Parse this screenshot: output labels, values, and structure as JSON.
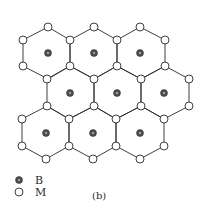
{
  "figure": {
    "label": "(b)"
  },
  "legend": {
    "items": [
      {
        "symbol": "filled-circle",
        "label": "B"
      },
      {
        "symbol": "open-circle",
        "label": "M"
      }
    ]
  },
  "colors": {
    "line": "#2a2a2a",
    "b_atom": "#4a4a4a",
    "m_atom_fill": "#ffffff"
  },
  "lattice": {
    "rows": 3,
    "hexagons_per_row": 3,
    "hexagon_centers_B": [
      [
        48,
        53
      ],
      [
        94,
        53
      ],
      [
        140,
        53
      ],
      [
        70,
        93
      ],
      [
        117,
        93
      ],
      [
        164,
        93
      ],
      [
        46,
        133
      ],
      [
        93,
        133
      ],
      [
        140,
        133
      ]
    ]
  }
}
